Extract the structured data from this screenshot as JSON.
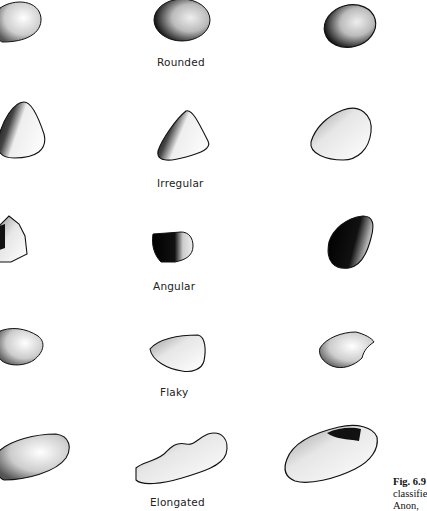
{
  "figure": {
    "caption": {
      "number": "Fig. 6.9",
      "line2": "classifie",
      "line3": "Anon,"
    },
    "rows": [
      {
        "label": "Rounded",
        "stones": 3
      },
      {
        "label": "Irregular",
        "stones": 3
      },
      {
        "label": "Angular",
        "stones": 3
      },
      {
        "label": "Flaky",
        "stones": 3
      },
      {
        "label": "Elongated",
        "stones": 3
      }
    ],
    "colors": {
      "background": "#ffffff",
      "ink": "#111111",
      "text": "#222222"
    }
  }
}
